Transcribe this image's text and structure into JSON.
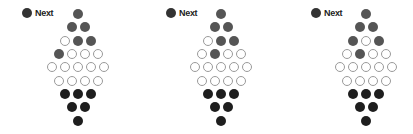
{
  "colors": {
    "gray": "#555555",
    "black": "#1e1e1e",
    "empty_border": "#9a9a9a"
  },
  "boards": [
    {
      "next_label": "Next",
      "next_color": "gray",
      "center_x": 78,
      "rows": [
        [
          "gray"
        ],
        [
          "gray",
          "gray"
        ],
        [
          "empty",
          "gray",
          "gray"
        ],
        [
          "gray",
          "empty",
          "empty",
          "empty"
        ],
        [
          "empty",
          "empty",
          "empty",
          "empty",
          "empty"
        ],
        [
          "empty",
          "empty",
          "empty",
          "empty"
        ],
        [
          "black",
          "black",
          "black"
        ],
        [
          "black",
          "black"
        ],
        [
          "black"
        ]
      ]
    },
    {
      "next_label": "Next",
      "next_color": "gray",
      "center_x": 221,
      "rows": [
        [
          "gray"
        ],
        [
          "gray",
          "gray"
        ],
        [
          "empty",
          "gray",
          "gray"
        ],
        [
          "empty",
          "gray",
          "empty",
          "empty"
        ],
        [
          "empty",
          "empty",
          "empty",
          "empty",
          "empty"
        ],
        [
          "empty",
          "empty",
          "empty",
          "empty"
        ],
        [
          "black",
          "black",
          "black"
        ],
        [
          "black",
          "black"
        ],
        [
          "black"
        ]
      ]
    },
    {
      "next_label": "Next",
      "next_color": "gray",
      "center_x": 366,
      "rows": [
        [
          "gray"
        ],
        [
          "gray",
          "gray"
        ],
        [
          "gray",
          "empty",
          "gray"
        ],
        [
          "empty",
          "gray",
          "empty",
          "empty"
        ],
        [
          "empty",
          "empty",
          "empty",
          "empty",
          "empty"
        ],
        [
          "empty",
          "empty",
          "empty",
          "empty"
        ],
        [
          "black",
          "black",
          "black"
        ],
        [
          "black",
          "black"
        ],
        [
          "black"
        ]
      ]
    }
  ]
}
